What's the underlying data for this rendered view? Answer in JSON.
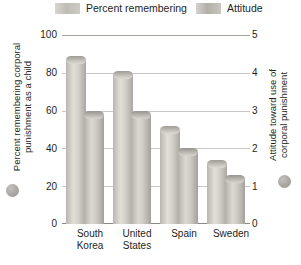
{
  "legend": {
    "entries": [
      {
        "label": "Percent remembering",
        "swatch": "percent-swatch"
      },
      {
        "label": "Attitude",
        "swatch": "attitude-swatch"
      }
    ]
  },
  "axes": {
    "left_title": "Percent remembering corporal\npunishment as a child",
    "right_title": "Attitude toward use of\ncorporal punishment",
    "left_ticks": [
      "100",
      "80",
      "60",
      "40",
      "20",
      "0"
    ],
    "right_ticks": [
      "5",
      "4",
      "3",
      "2",
      "1",
      "0"
    ]
  },
  "categories": [
    "South\nKorea",
    "United\nStates",
    "Spain",
    "Sweden"
  ],
  "chart_data": {
    "type": "bar",
    "title": "",
    "categories": [
      "South Korea",
      "United States",
      "Spain",
      "Sweden"
    ],
    "series": [
      {
        "name": "Percent remembering",
        "axis": "left",
        "values": [
          89,
          81,
          52,
          34
        ]
      },
      {
        "name": "Attitude",
        "axis": "right",
        "values": [
          3.0,
          3.0,
          2.0,
          1.3
        ]
      }
    ],
    "xlabel": "",
    "ylabel": "Percent remembering corporal punishment as a child",
    "y2label": "Attitude toward use of corporal punishment",
    "ylim": [
      0,
      100
    ],
    "y2lim": [
      0,
      5
    ],
    "yticks": [
      0,
      20,
      40,
      60,
      80,
      100
    ],
    "y2ticks": [
      0,
      1,
      2,
      3,
      4,
      5
    ],
    "grid": true,
    "legend_position": "top"
  },
  "colors": {
    "bar_percent": "#cdcac4",
    "bar_attitude": "#c2bfb9",
    "gridline": "#c9c7c4",
    "text": "#231f20"
  }
}
